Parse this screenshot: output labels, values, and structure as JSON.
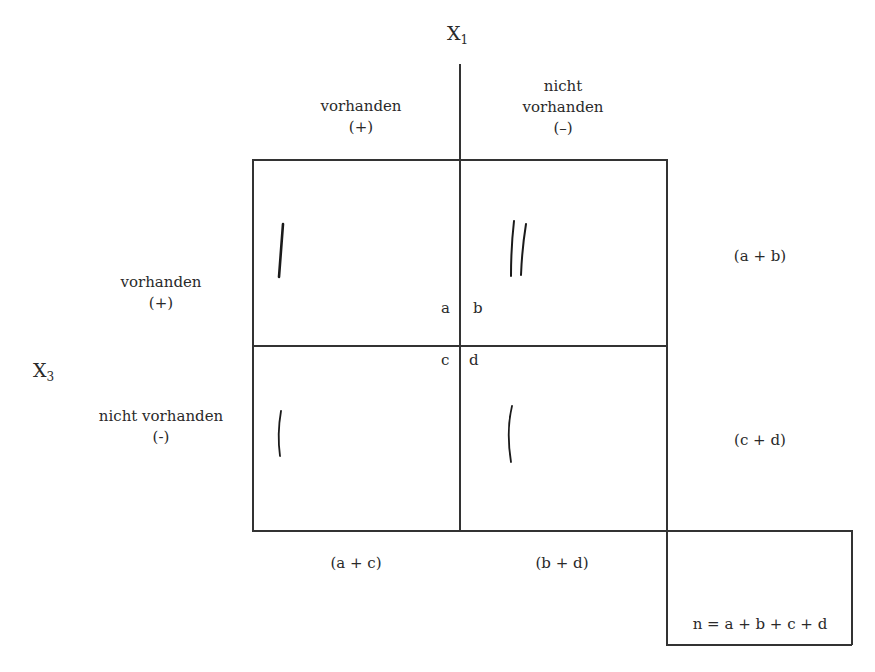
{
  "variables": {
    "x1": {
      "base": "X",
      "sub": "1"
    },
    "x3": {
      "base": "X",
      "sub": "3"
    }
  },
  "columns": [
    {
      "label": "vorhanden",
      "sign": "(+)"
    },
    {
      "label_line1": "nicht",
      "label_line2": "vorhanden",
      "sign": "(–)"
    }
  ],
  "rows": [
    {
      "label": "vorhanden",
      "sign": "(+)"
    },
    {
      "label": "nicht vorhanden",
      "sign": "(-)"
    }
  ],
  "cells": [
    {
      "letter": "a",
      "tally": 1
    },
    {
      "letter": "b",
      "tally": 2
    },
    {
      "letter": "c",
      "tally": 1
    },
    {
      "letter": "d",
      "tally": 1
    }
  ],
  "row_totals": [
    "(a + b)",
    "(c + d)"
  ],
  "column_totals": [
    "(a + c)",
    "(b + d)"
  ],
  "grand_total": "n = a + b + c + d"
}
